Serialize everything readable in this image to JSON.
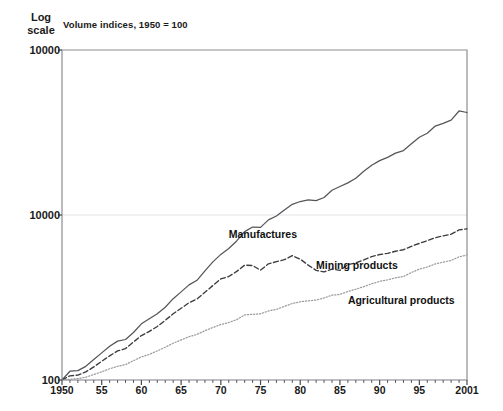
{
  "header": {
    "y_axis_caption": "Log\nscale",
    "subtitle": "Volume indices, 1950 = 100"
  },
  "chart_data": {
    "type": "line",
    "title": "",
    "subtitle": "Volume indices, 1950 = 100",
    "xlabel": "",
    "ylabel": "Log scale",
    "yscale": "log",
    "grid": true,
    "legend_position": "inline-annotation",
    "y_tick_labels": [
      "10000",
      "10000",
      "100"
    ],
    "y_tick_positions": [
      10000,
      1000,
      100
    ],
    "ylim": [
      100,
      10000
    ],
    "x_tick_labels": [
      "1950",
      "55",
      "60",
      "65",
      "70",
      "75",
      "80",
      "85",
      "90",
      "95",
      "2001"
    ],
    "x_tick_values": [
      1950,
      1955,
      1960,
      1965,
      1970,
      1975,
      1980,
      1985,
      1990,
      1995,
      2001
    ],
    "xlim": [
      1950,
      2001
    ],
    "minor_ticks": "annual",
    "annotations": [
      {
        "text": "Manufactures",
        "x": 1971,
        "y": 760
      },
      {
        "text": "Mining products",
        "x": 1982,
        "y": 490
      },
      {
        "text": "Agricultural products",
        "x": 1986,
        "y": 300
      }
    ],
    "x": [
      1950,
      1951,
      1952,
      1953,
      1954,
      1955,
      1956,
      1957,
      1958,
      1959,
      1960,
      1961,
      1962,
      1963,
      1964,
      1965,
      1966,
      1967,
      1968,
      1969,
      1970,
      1971,
      1972,
      1973,
      1974,
      1975,
      1976,
      1977,
      1978,
      1979,
      1980,
      1981,
      1982,
      1983,
      1984,
      1985,
      1986,
      1987,
      1988,
      1989,
      1990,
      1991,
      1992,
      1993,
      1994,
      1995,
      1996,
      1997,
      1998,
      1999,
      2000,
      2001
    ],
    "series": [
      {
        "name": "Manufactures",
        "style": "solid",
        "color": "#55555a",
        "values": [
          100,
          113,
          114,
          121,
          133,
          146,
          160,
          172,
          176,
          194,
          219,
          235,
          252,
          276,
          311,
          342,
          377,
          402,
          459,
          520,
          577,
          627,
          696,
          793,
          845,
          841,
          934,
          987,
          1072,
          1160,
          1207,
          1236,
          1221,
          1276,
          1412,
          1488,
          1566,
          1672,
          1839,
          2001,
          2136,
          2235,
          2370,
          2457,
          2700,
          2960,
          3130,
          3460,
          3590,
          3760,
          4270,
          4180
        ]
      },
      {
        "name": "Mining products",
        "style": "dashed",
        "color": "#3c3c40",
        "values": [
          100,
          106,
          107,
          112,
          120,
          130,
          140,
          150,
          155,
          170,
          186,
          197,
          211,
          230,
          252,
          272,
          294,
          310,
          340,
          374,
          410,
          424,
          455,
          497,
          494,
          463,
          506,
          521,
          536,
          567,
          540,
          497,
          462,
          452,
          470,
          462,
          500,
          512,
          534,
          560,
          576,
          586,
          603,
          616,
          646,
          673,
          699,
          728,
          748,
          765,
          812,
          824
        ]
      },
      {
        "name": "Agricultural products",
        "style": "dotted",
        "color": "#9a9aa0",
        "values": [
          100,
          101,
          102,
          104,
          108,
          112,
          117,
          121,
          124,
          131,
          138,
          143,
          150,
          158,
          167,
          175,
          183,
          189,
          199,
          208,
          217,
          223,
          232,
          248,
          250,
          252,
          262,
          268,
          279,
          291,
          298,
          302,
          305,
          314,
          327,
          330,
          344,
          355,
          368,
          383,
          396,
          405,
          416,
          424,
          448,
          470,
          484,
          505,
          518,
          530,
          558,
          572
        ]
      }
    ]
  }
}
